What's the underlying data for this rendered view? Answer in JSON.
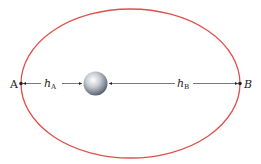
{
  "diagram": {
    "orbit_color": "#e0504a",
    "points": [
      {
        "id": "A",
        "label": "A"
      },
      {
        "id": "B",
        "label": "B"
      }
    ],
    "distances": [
      {
        "id": "hA",
        "symbol": "h",
        "subscript": "A"
      },
      {
        "id": "hB",
        "symbol": "h",
        "subscript": "B"
      }
    ],
    "planet": {
      "name": "planet"
    }
  }
}
